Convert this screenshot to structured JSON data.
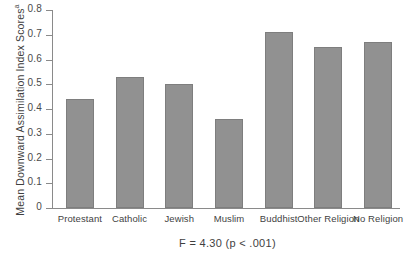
{
  "chart_data": {
    "type": "bar",
    "title": "",
    "xlabel": "",
    "ylabel": "Mean Downward Assimilation Index Scores",
    "ylabel_superscript": "a",
    "categories": [
      "Protestant",
      "Catholic",
      "Jewish",
      "Muslim",
      "Buddhist",
      "Other Religion",
      "No Religion"
    ],
    "values": [
      0.44,
      0.53,
      0.5,
      0.36,
      0.71,
      0.65,
      0.67
    ],
    "ylim": [
      0,
      0.8
    ],
    "ytick_values": [
      0,
      0.1,
      0.2,
      0.3,
      0.4,
      0.5,
      0.6,
      0.7,
      0.8
    ],
    "ytick_labels": [
      "0",
      "0.1",
      "0.2",
      "0.3",
      "0.4",
      "0.5",
      "0.6",
      "0.7",
      "0.8"
    ],
    "grid": false,
    "legend": "none",
    "bar_color": "#919191",
    "bar_border_color": "#7e7e7e",
    "axis_color": "#8a8a8a",
    "annotation": "F = 4.30 (p < .001)"
  },
  "footnote": {
    "text": "F = 4.30 (p < .001)"
  }
}
